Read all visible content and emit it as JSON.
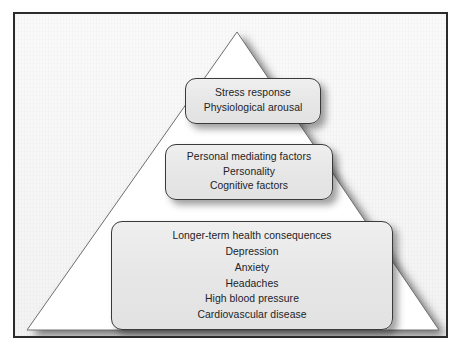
{
  "figure": {
    "type": "pyramid-diagram",
    "title": "",
    "colors": {
      "frame_border": "#2b2b2d",
      "page_background": "#f7f7f8",
      "triangle_fill": "#ffffff",
      "triangle_stroke": "#6e6e70",
      "box_fill": "#e9e9ea",
      "box_border": "#3a3a3c",
      "text": "#232326",
      "shadow": "#3c3c3c"
    },
    "shapes": {
      "triangle_name": "pyramid-triangle",
      "apex": {
        "x": 222,
        "y": 18
      },
      "bottom_left": {
        "x": 12,
        "y": 316
      },
      "bottom_right": {
        "x": 424,
        "y": 316
      }
    }
  },
  "levels": [
    {
      "id": "stress-response",
      "position": "top",
      "lines": [
        "Stress response",
        "Physiological arousal"
      ]
    },
    {
      "id": "personal-mediating-factors",
      "position": "middle",
      "lines": [
        "Personal mediating factors",
        "Personality",
        "Cognitive factors"
      ]
    },
    {
      "id": "longer-term-health-consequences",
      "position": "bottom",
      "lines": [
        "Longer-term health consequences",
        "Depression",
        "Anxiety",
        "Headaches",
        "High blood pressure",
        "Cardiovascular disease"
      ]
    }
  ]
}
